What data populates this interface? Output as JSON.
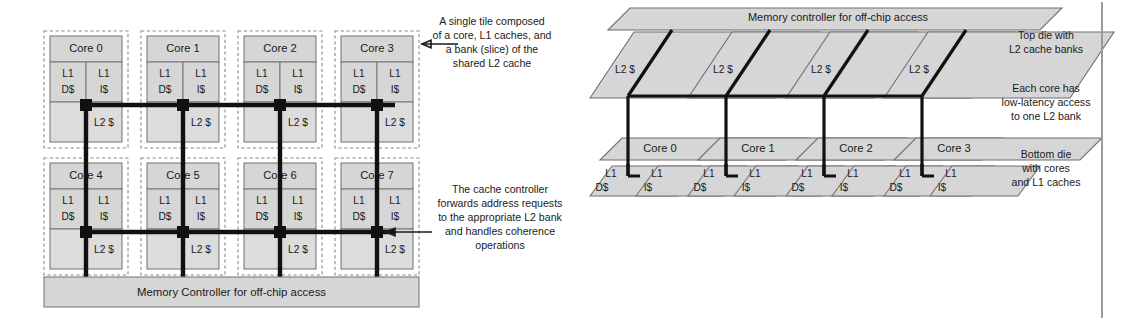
{
  "figure": {
    "left_diagram": {
      "name": "tiled-multicore-2d-floorplan",
      "tiles": [
        {
          "core": "Core 0",
          "l1d": [
            "L1",
            "D$"
          ],
          "l1i": [
            "L1",
            "I$"
          ],
          "l2": "L2 $"
        },
        {
          "core": "Core 1",
          "l1d": [
            "L1",
            "D$"
          ],
          "l1i": [
            "L1",
            "I$"
          ],
          "l2": "L2 $"
        },
        {
          "core": "Core 2",
          "l1d": [
            "L1",
            "D$"
          ],
          "l1i": [
            "L1",
            "I$"
          ],
          "l2": "L2 $"
        },
        {
          "core": "Core 3",
          "l1d": [
            "L1",
            "D$"
          ],
          "l1i": [
            "L1",
            "I$"
          ],
          "l2": "L2 $"
        },
        {
          "core": "Core 4",
          "l1d": [
            "L1",
            "D$"
          ],
          "l1i": [
            "L1",
            "I$"
          ],
          "l2": "L2 $"
        },
        {
          "core": "Core 5",
          "l1d": [
            "L1",
            "D$"
          ],
          "l1i": [
            "L1",
            "I$"
          ],
          "l2": "L2 $"
        },
        {
          "core": "Core 6",
          "l1d": [
            "L1",
            "D$"
          ],
          "l1i": [
            "L1",
            "I$"
          ],
          "l2": "L2 $"
        },
        {
          "core": "Core 7",
          "l1d": [
            "L1",
            "D$"
          ],
          "l1i": [
            "L1",
            "I$"
          ],
          "l2": "L2 $"
        }
      ],
      "memory_controller": "Memory Controller for off-chip access"
    },
    "annotations_center": {
      "tile_note": [
        "A single tile composed",
        "of a core, L1 caches, and",
        "a bank (slice) of the",
        "shared L2 cache"
      ],
      "controller_note": [
        "The cache controller",
        "forwards address requests",
        "to the appropriate L2 bank",
        "and handles coherence",
        "operations"
      ]
    },
    "right_diagram": {
      "name": "3d-stacked-die",
      "memory_controller": "Memory controller for off-chip access",
      "top_die_banks": [
        "L2 $",
        "L2 $",
        "L2 $",
        "L2 $"
      ],
      "bottom_die_cores": [
        "Core 0",
        "Core 1",
        "Core 2",
        "Core 3"
      ],
      "bottom_die_l1": [
        {
          "d": [
            "L1",
            "D$"
          ],
          "i": [
            "L1",
            "I$"
          ]
        },
        {
          "d": [
            "L1",
            "D$"
          ],
          "i": [
            "L1",
            "I$"
          ]
        },
        {
          "d": [
            "L1",
            "D$"
          ],
          "i": [
            "L1",
            "I$"
          ]
        },
        {
          "d": [
            "L1",
            "D$"
          ],
          "i": [
            "L1",
            "I$"
          ]
        }
      ]
    },
    "annotations_right": {
      "top_die": [
        "Top die with",
        "L2 cache banks"
      ],
      "latency": [
        "Each core has",
        "low-latency access",
        "to one L2 bank"
      ],
      "bottom_die": [
        "Bottom die",
        "with cores",
        "and L1 caches"
      ]
    },
    "colors": {
      "box_fill": "#d6d6d6",
      "box_stroke": "#7c7c7c",
      "bus": "#111111",
      "background": "#ffffff"
    }
  }
}
